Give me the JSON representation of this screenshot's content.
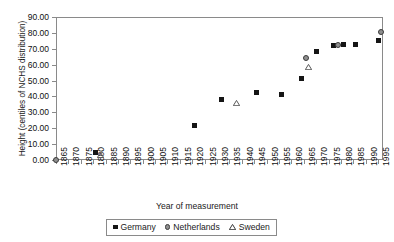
{
  "chart_data": {
    "type": "scatter",
    "title": "",
    "xlabel": "Year of measurement",
    "ylabel": "Height (centiles of NCHS distribution)",
    "xlim": [
      1865,
      1997
    ],
    "ylim": [
      0,
      90
    ],
    "ytick_step": 10,
    "grid": false,
    "legend_position": "bottom-center",
    "ytick_labels": [
      "90.00",
      "80.00",
      "70.00",
      "60.00",
      "50.00",
      "40.00",
      "30.00",
      "20.00",
      "10.00",
      "0.00"
    ],
    "ytick_values": [
      90,
      80,
      70,
      60,
      50,
      40,
      30,
      20,
      10,
      0
    ],
    "xtick_labels": [
      "1865",
      "1870",
      "1875",
      "1880",
      "1885",
      "1890",
      "1895",
      "1900",
      "1905",
      "1910",
      "1915",
      "1920",
      "1925",
      "1930",
      "1935",
      "1940",
      "1945",
      "1950",
      "1955",
      "1960",
      "1965",
      "1970",
      "1975",
      "1980",
      "1985",
      "1990",
      "1995"
    ],
    "xtick_values": [
      1865,
      1870,
      1875,
      1880,
      1885,
      1890,
      1895,
      1900,
      1905,
      1910,
      1915,
      1920,
      1925,
      1930,
      1935,
      1940,
      1945,
      1950,
      1955,
      1960,
      1965,
      1970,
      1975,
      1980,
      1985,
      1990,
      1995
    ],
    "series": [
      {
        "name": "Germany",
        "marker": "filled-square",
        "color": "#151515",
        "points": [
          {
            "x": 1881,
            "y": 5.0
          },
          {
            "x": 1921,
            "y": 22.0
          },
          {
            "x": 1932,
            "y": 38.0
          },
          {
            "x": 1946,
            "y": 42.5
          },
          {
            "x": 1956,
            "y": 41.5
          },
          {
            "x": 1964,
            "y": 51.5
          },
          {
            "x": 1970,
            "y": 68.0
          },
          {
            "x": 1977,
            "y": 72.0
          },
          {
            "x": 1981,
            "y": 72.5
          },
          {
            "x": 1986,
            "y": 72.5
          },
          {
            "x": 1995,
            "y": 75.0
          }
        ]
      },
      {
        "name": "Netherlands",
        "marker": "filled-circle",
        "color": "#8f8f8f",
        "points": [
          {
            "x": 1865,
            "y": 0.0
          },
          {
            "x": 1966,
            "y": 64.5
          },
          {
            "x": 1979,
            "y": 72.5
          },
          {
            "x": 1996,
            "y": 80.5
          }
        ]
      },
      {
        "name": "Sweden",
        "marker": "open-triangle",
        "color": "#5a5a5a",
        "points": [
          {
            "x": 1883,
            "y": 3.0
          },
          {
            "x": 1938,
            "y": 36.0
          },
          {
            "x": 1967,
            "y": 58.5
          }
        ]
      }
    ]
  },
  "legend": {
    "items": [
      {
        "label": "Germany",
        "marker": "filled-square"
      },
      {
        "label": "Netherlands",
        "marker": "filled-circle"
      },
      {
        "label": "Sweden",
        "marker": "open-triangle"
      }
    ]
  }
}
